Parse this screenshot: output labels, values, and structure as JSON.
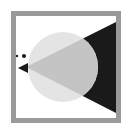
{
  "image": {
    "description": "Abstract geometric icon: gray square frame containing a light circle, a black triangle pointing left, a small black triangle and two dots",
    "colors": {
      "background": "#ffffff",
      "frame": "#9a9a9a",
      "circle": "#e4e4e4",
      "overlap": "#c4c4c4",
      "triangle": "#1a1a1a",
      "dots": "#1a1a1a"
    },
    "shapes": {
      "frame": {
        "x": 13,
        "y": 13,
        "width": 105,
        "height": 107,
        "stroke_width": 5
      },
      "circle": {
        "cx": 63,
        "cy": 67,
        "r": 35
      },
      "big_triangle": {
        "points": "116,22 116,113 26,67"
      },
      "small_triangle": {
        "points": "18,68 28,63 28,73"
      },
      "dot_small": {
        "cx": 17,
        "cy": 56,
        "r": 1.2
      },
      "dot_large": {
        "cx": 24,
        "cy": 56,
        "r": 2
      }
    }
  }
}
